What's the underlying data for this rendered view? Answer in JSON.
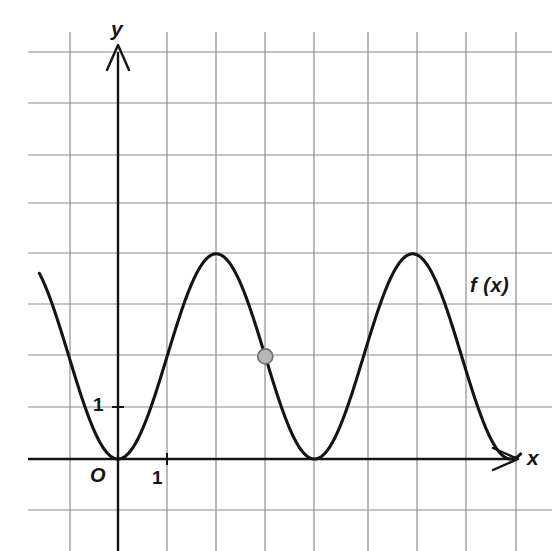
{
  "figure": {
    "kind": "cartesian-graph",
    "background_color": "#ffffff",
    "axis_color": "#141414",
    "grid_color": "#8c8c8c",
    "curve_color": "#141414",
    "point_fill_color": "#b5b5b5",
    "point_stroke_color": "#6e6e6e"
  },
  "labels": {
    "y_axis": "y",
    "x_axis": "x",
    "origin": "O",
    "y_tick_one": "1",
    "x_tick_one": "1",
    "curve": "f (x)"
  },
  "chart_data": {
    "type": "line",
    "title": "",
    "xlabel": "x",
    "ylabel": "y",
    "grid": true,
    "legend": "none",
    "xlim": [
      -1.6,
      8.2
    ],
    "ylim": [
      -1.0,
      8.0
    ],
    "xticks": [
      0,
      1
    ],
    "xtick_labels": [
      "O",
      "1"
    ],
    "yticks": [
      1
    ],
    "ytick_labels": [
      "1"
    ],
    "x_grid_spacing": 1,
    "y_grid_spacing": 1,
    "series": [
      {
        "name": "f (x)",
        "label": "f (x)",
        "equation": "f(x) = 2 - 2 cos(pi x / 2)",
        "amplitude": 2,
        "midline": 2,
        "period": 4,
        "minima": [
          [
            0,
            0
          ],
          [
            4,
            0
          ]
        ],
        "maxima": [
          [
            2,
            4
          ],
          [
            6,
            4
          ]
        ],
        "x": [
          -1.6,
          -1.4,
          -1.2,
          -1.0,
          -0.8,
          -0.6,
          -0.4,
          -0.2,
          0.0,
          0.2,
          0.4,
          0.6,
          0.8,
          1.0,
          1.2,
          1.4,
          1.6,
          1.8,
          2.0,
          2.2,
          2.4,
          2.6,
          2.8,
          3.0,
          3.2,
          3.4,
          3.6,
          3.8,
          4.0,
          4.2,
          4.4,
          4.6,
          4.8,
          5.0,
          5.2,
          5.4,
          5.6,
          5.8,
          6.0,
          6.2,
          6.4,
          6.6,
          6.8,
          7.0,
          7.2,
          7.4,
          7.6,
          7.8,
          8.0
        ],
        "y": [
          3.9,
          3.62,
          3.18,
          2.62,
          2.0,
          1.38,
          0.82,
          0.38,
          0.0,
          0.1,
          0.38,
          0.82,
          1.38,
          2.0,
          2.62,
          3.18,
          3.62,
          3.9,
          4.0,
          3.9,
          3.62,
          3.18,
          2.62,
          2.0,
          1.38,
          0.82,
          0.38,
          0.1,
          0.0,
          0.1,
          0.38,
          0.82,
          1.38,
          2.0,
          2.62,
          3.18,
          3.62,
          3.9,
          4.0,
          3.9,
          3.62,
          3.18,
          2.62,
          2.0,
          1.38,
          0.82,
          0.38,
          0.1,
          0.0
        ]
      }
    ],
    "annotations": [
      {
        "name": "marked-point",
        "kind": "point-marker",
        "x": 3,
        "y": 2,
        "label": ""
      }
    ]
  }
}
